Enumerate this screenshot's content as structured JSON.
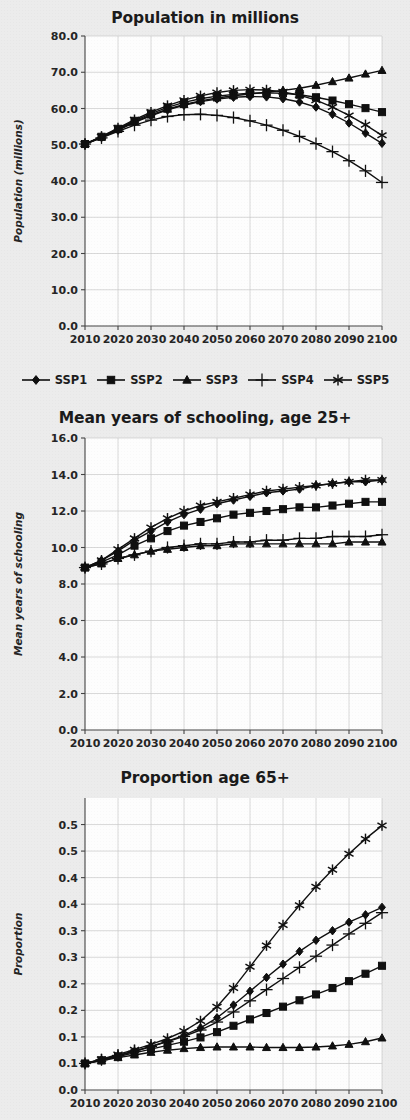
{
  "figure": {
    "background_color": "#ececec",
    "plot_background_color": "#fdfdfd",
    "series_color": "#101010",
    "grid_color": "#c9c9c9"
  },
  "legend": {
    "position": "below-first-chart",
    "entries": [
      {
        "label": "SSP1",
        "marker": "diamond"
      },
      {
        "label": "SSP2",
        "marker": "square"
      },
      {
        "label": "SSP3",
        "marker": "triangle"
      },
      {
        "label": "SSP4",
        "marker": "plus"
      },
      {
        "label": "SSP5",
        "marker": "asterisk"
      }
    ]
  },
  "chart_data": [
    {
      "id": "population",
      "type": "line",
      "title": "Population in millions",
      "xlabel": "",
      "ylabel": "Population (millions)",
      "x": [
        2010,
        2015,
        2020,
        2025,
        2030,
        2035,
        2040,
        2045,
        2050,
        2055,
        2060,
        2065,
        2070,
        2075,
        2080,
        2085,
        2090,
        2095,
        2100
      ],
      "xlim": [
        2010,
        2100
      ],
      "ylim": [
        0.0,
        80.0
      ],
      "ytick_labels": [
        "0.0",
        "10.0",
        "20.0",
        "30.0",
        "40.0",
        "50.0",
        "60.0",
        "70.0",
        "80.0"
      ],
      "ytick_values": [
        0,
        10,
        20,
        30,
        40,
        50,
        60,
        70,
        80
      ],
      "xtick_labels": [
        "2010",
        "2020",
        "2030",
        "2040",
        "2050",
        "2060",
        "2070",
        "2080",
        "2090",
        "2100"
      ],
      "xtick_values": [
        2010,
        2020,
        2030,
        2040,
        2050,
        2060,
        2070,
        2080,
        2090,
        2100
      ],
      "grid": true,
      "series": [
        {
          "name": "SSP1",
          "marker": "diamond",
          "values": [
            50.2,
            52.0,
            54.0,
            56.2,
            58.0,
            59.6,
            60.9,
            61.9,
            62.6,
            63.1,
            63.3,
            63.2,
            62.7,
            61.8,
            60.4,
            58.4,
            56.0,
            53.2,
            50.4
          ]
        },
        {
          "name": "SSP2",
          "marker": "square",
          "values": [
            50.2,
            52.2,
            54.4,
            56.6,
            58.6,
            60.3,
            61.7,
            62.7,
            63.4,
            63.9,
            64.2,
            64.3,
            64.2,
            63.8,
            63.1,
            62.2,
            61.2,
            60.1,
            59.0
          ]
        },
        {
          "name": "SSP3",
          "marker": "triangle",
          "values": [
            50.2,
            52.1,
            54.2,
            56.3,
            58.2,
            59.8,
            61.1,
            62.1,
            62.9,
            63.5,
            64.0,
            64.5,
            65.0,
            65.6,
            66.4,
            67.4,
            68.4,
            69.5,
            70.5
          ]
        },
        {
          "name": "SSP4",
          "marker": "plus",
          "values": [
            50.2,
            51.9,
            53.7,
            55.4,
            56.8,
            57.8,
            58.3,
            58.4,
            58.1,
            57.5,
            56.6,
            55.4,
            54.0,
            52.3,
            50.3,
            48.1,
            45.6,
            42.8,
            39.6
          ]
        },
        {
          "name": "SSP5",
          "marker": "asterisk",
          "values": [
            50.2,
            52.3,
            54.6,
            56.9,
            59.0,
            60.8,
            62.3,
            63.5,
            64.4,
            65.0,
            65.2,
            65.1,
            64.6,
            63.7,
            62.3,
            60.4,
            58.1,
            55.5,
            52.6
          ]
        }
      ]
    },
    {
      "id": "schooling",
      "type": "line",
      "title": "Mean years of schooling, age 25+",
      "xlabel": "",
      "ylabel": "Mean years of schooling",
      "x": [
        2010,
        2015,
        2020,
        2025,
        2030,
        2035,
        2040,
        2045,
        2050,
        2055,
        2060,
        2065,
        2070,
        2075,
        2080,
        2085,
        2090,
        2095,
        2100
      ],
      "xlim": [
        2010,
        2100
      ],
      "ylim": [
        0.0,
        16.0
      ],
      "ytick_labels": [
        "0.0",
        "2.0",
        "4.0",
        "6.0",
        "8.0",
        "10.0",
        "12.0",
        "14.0",
        "16.0"
      ],
      "ytick_values": [
        0,
        2,
        4,
        6,
        8,
        10,
        12,
        14,
        16
      ],
      "xtick_labels": [
        "2010",
        "2020",
        "2030",
        "2040",
        "2050",
        "2060",
        "2070",
        "2080",
        "2090",
        "2100"
      ],
      "xtick_values": [
        2010,
        2020,
        2030,
        2040,
        2050,
        2060,
        2070,
        2080,
        2090,
        2100
      ],
      "grid": true,
      "series": [
        {
          "name": "SSP1",
          "marker": "diamond",
          "values": [
            8.9,
            9.3,
            9.8,
            10.4,
            10.9,
            11.4,
            11.8,
            12.1,
            12.4,
            12.6,
            12.8,
            13.0,
            13.1,
            13.2,
            13.4,
            13.5,
            13.6,
            13.6,
            13.7
          ]
        },
        {
          "name": "SSP2",
          "marker": "square",
          "values": [
            8.9,
            9.2,
            9.6,
            10.1,
            10.5,
            10.9,
            11.2,
            11.4,
            11.6,
            11.8,
            11.9,
            12.0,
            12.1,
            12.2,
            12.2,
            12.3,
            12.4,
            12.5,
            12.5
          ]
        },
        {
          "name": "SSP3",
          "marker": "triangle",
          "values": [
            8.9,
            9.1,
            9.4,
            9.6,
            9.8,
            9.9,
            10.0,
            10.1,
            10.1,
            10.2,
            10.2,
            10.2,
            10.2,
            10.2,
            10.2,
            10.2,
            10.3,
            10.3,
            10.3
          ]
        },
        {
          "name": "SSP4",
          "marker": "plus",
          "values": [
            8.9,
            9.1,
            9.4,
            9.6,
            9.8,
            10.0,
            10.1,
            10.2,
            10.2,
            10.3,
            10.3,
            10.4,
            10.4,
            10.5,
            10.5,
            10.6,
            10.6,
            10.6,
            10.7
          ]
        },
        {
          "name": "SSP5",
          "marker": "asterisk",
          "values": [
            8.9,
            9.3,
            9.9,
            10.5,
            11.1,
            11.6,
            12.0,
            12.3,
            12.5,
            12.7,
            12.9,
            13.1,
            13.2,
            13.3,
            13.4,
            13.5,
            13.6,
            13.7,
            13.7
          ]
        }
      ]
    },
    {
      "id": "proportion-65plus",
      "type": "line",
      "title": "Proportion age 65+",
      "xlabel": "",
      "ylabel": "Proportion",
      "x": [
        2010,
        2015,
        2020,
        2025,
        2030,
        2035,
        2040,
        2045,
        2050,
        2055,
        2060,
        2065,
        2070,
        2075,
        2080,
        2085,
        2090,
        2095,
        2100
      ],
      "xlim": [
        2010,
        2100
      ],
      "ylim": [
        0.0,
        0.55
      ],
      "ytick_labels": [
        "0.0",
        "0.1",
        "0.1",
        "0.2",
        "0.2",
        "0.3",
        "0.3",
        "0.4",
        "0.4",
        "0.5",
        "0.5"
      ],
      "ytick_values": [
        0.0,
        0.05,
        0.1,
        0.15,
        0.2,
        0.25,
        0.3,
        0.35,
        0.4,
        0.45,
        0.5
      ],
      "xtick_labels": [
        "2010",
        "2020",
        "2030",
        "2040",
        "2050",
        "2060",
        "2070",
        "2080",
        "2090",
        "2100"
      ],
      "xtick_values": [
        2010,
        2020,
        2030,
        2040,
        2050,
        2060,
        2070,
        2080,
        2090,
        2100
      ],
      "grid": true,
      "series": [
        {
          "name": "SSP1",
          "marker": "diamond",
          "values": [
            0.05,
            0.057,
            0.065,
            0.073,
            0.082,
            0.092,
            0.103,
            0.117,
            0.136,
            0.16,
            0.186,
            0.212,
            0.237,
            0.261,
            0.282,
            0.3,
            0.316,
            0.33,
            0.344
          ]
        },
        {
          "name": "SSP2",
          "marker": "square",
          "values": [
            0.05,
            0.056,
            0.063,
            0.07,
            0.077,
            0.084,
            0.091,
            0.099,
            0.109,
            0.121,
            0.133,
            0.145,
            0.157,
            0.169,
            0.18,
            0.192,
            0.205,
            0.219,
            0.234
          ]
        },
        {
          "name": "SSP3",
          "marker": "triangle",
          "values": [
            0.05,
            0.055,
            0.061,
            0.066,
            0.071,
            0.075,
            0.078,
            0.08,
            0.081,
            0.081,
            0.081,
            0.08,
            0.08,
            0.08,
            0.081,
            0.083,
            0.086,
            0.091,
            0.098
          ]
        },
        {
          "name": "SSP4",
          "marker": "plus",
          "values": [
            0.05,
            0.057,
            0.065,
            0.073,
            0.082,
            0.091,
            0.101,
            0.113,
            0.128,
            0.147,
            0.168,
            0.189,
            0.21,
            0.231,
            0.252,
            0.273,
            0.294,
            0.314,
            0.334
          ]
        },
        {
          "name": "SSP5",
          "marker": "asterisk",
          "values": [
            0.05,
            0.058,
            0.067,
            0.076,
            0.086,
            0.097,
            0.111,
            0.13,
            0.157,
            0.192,
            0.232,
            0.272,
            0.311,
            0.348,
            0.383,
            0.415,
            0.445,
            0.473,
            0.498
          ]
        }
      ]
    }
  ]
}
